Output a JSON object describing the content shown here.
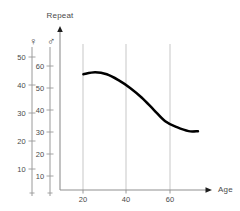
{
  "chart_data": {
    "type": "line",
    "title": "",
    "ylabel": "Repeat",
    "xlabel": "Age",
    "grid": true,
    "legend_position": "none",
    "x": [
      15,
      20,
      25,
      30,
      35,
      40,
      45,
      50,
      55,
      60,
      64
    ],
    "series": [
      {
        "name": "Repeat vs Age",
        "axis": "male",
        "values": [
          59,
          60,
          59,
          56,
          52,
          47,
          41,
          35,
          32,
          30,
          30
        ]
      }
    ],
    "x_axis": {
      "label": "Age",
      "ticks": [
        20,
        40,
        60
      ],
      "tick_labels": [
        "20",
        "40",
        "60"
      ],
      "xlim": [
        5,
        70
      ]
    },
    "y_axes": [
      {
        "id": "female",
        "symbol": "♀",
        "symbol_name": "venus-female-symbol",
        "tick_labels": [
          "50",
          "40",
          "30",
          "20",
          "10"
        ],
        "ticks": [
          50,
          40,
          30,
          20,
          10
        ],
        "ylim": [
          0,
          55
        ]
      },
      {
        "id": "male",
        "symbol": "♂",
        "symbol_name": "mars-male-symbol",
        "tick_labels": [
          "60",
          "50",
          "40",
          "30",
          "20",
          "10"
        ],
        "ticks": [
          60,
          50,
          40,
          30,
          20,
          10
        ],
        "ylim": [
          0,
          66
        ]
      }
    ],
    "annotations": [],
    "colors": {
      "curve": "#000000",
      "axis": "#8f8f8f",
      "grid": "#b9b9b9",
      "text": "#4a4a4a",
      "background": "#ffffff"
    }
  }
}
